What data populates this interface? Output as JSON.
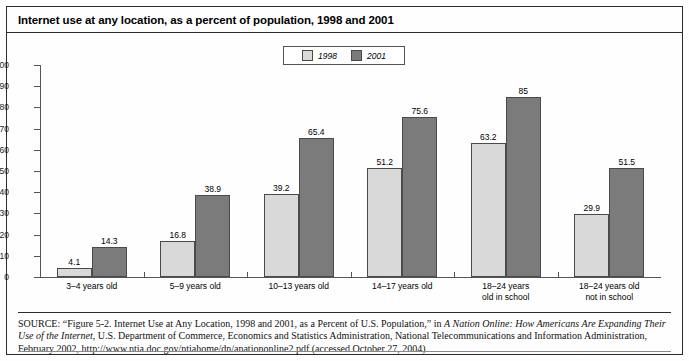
{
  "figure": {
    "title": "Internet use at any location, as a percent of population, 1998 and 2001"
  },
  "legend": {
    "items": [
      {
        "label": "1998",
        "color": "#d9d9d9"
      },
      {
        "label": "2001",
        "color": "#7b7b7b"
      }
    ]
  },
  "source": {
    "prefix": "SOURCE:",
    "part1": " “Figure 5-2. Internet Use at Any Location, 1998 and 2001, as a Percent of U.S. Population,” in ",
    "italic1": "A Nation Online: How Americans Are Expanding Their Use of the Internet,",
    "part2": " U.S. Department of Commerce, Economics and Statistics Administration, National Telecommunications and Information Administration, February 2002, http://www.ntia.doc.gov/ntiahome/dn/anationonline2.pdf (accessed October 27, 2004)"
  },
  "chart_data": {
    "type": "bar",
    "title": "Internet use at any location, as a percent of population, 1998 and 2001",
    "xlabel": "",
    "ylabel": "",
    "ylim": [
      0,
      100
    ],
    "yticks": [
      0,
      10,
      20,
      30,
      40,
      50,
      60,
      70,
      80,
      90,
      100
    ],
    "ytick_labels": [
      "0",
      "10",
      "20",
      "30",
      "40",
      "50",
      "60",
      "70",
      "80",
      "90",
      "100"
    ],
    "grid": false,
    "legend_position": "top-center",
    "categories": [
      "3–4 years old",
      "5–9 years old",
      "10–13 years old",
      "14–17 years old",
      "18–24 years\nold in school",
      "18–24 years old\nnot in school"
    ],
    "series": [
      {
        "name": "1998",
        "color": "#d9d9d9",
        "values": [
          4.1,
          16.8,
          39.2,
          51.2,
          63.2,
          29.9
        ],
        "labels": [
          "4.1",
          "16.8",
          "39.2",
          "51.2",
          "63.2",
          "29.9"
        ]
      },
      {
        "name": "2001",
        "color": "#7b7b7b",
        "values": [
          14.3,
          38.9,
          65.4,
          75.6,
          85,
          51.5
        ],
        "labels": [
          "14.3",
          "38.9",
          "65.4",
          "75.6",
          "85",
          "51.5"
        ]
      }
    ]
  }
}
